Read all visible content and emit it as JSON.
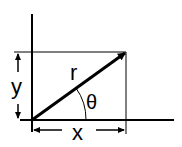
{
  "diagram": {
    "type": "polar-coordinates",
    "labels": {
      "radius": "r",
      "angle": "θ",
      "horizontal": "x",
      "vertical": "y"
    },
    "colors": {
      "stroke": "#000000",
      "background": "#ffffff"
    }
  }
}
